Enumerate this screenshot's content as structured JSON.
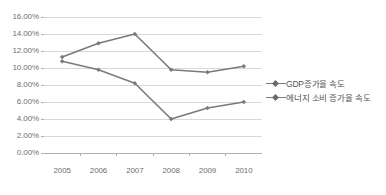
{
  "chart_data": {
    "type": "line",
    "title": "",
    "xlabel": "",
    "ylabel": "",
    "categories": [
      "2005",
      "2006",
      "2007",
      "2008",
      "2009",
      "2010"
    ],
    "ylim": [
      0,
      16
    ],
    "ytick_step": 2,
    "ytick_labels": [
      "16.00%",
      "14.00%",
      "12.00%",
      "10.00%",
      "8.00%",
      "6.00%",
      "4.00%",
      "2.00%",
      "0.00%"
    ],
    "ytick_values": [
      16,
      14,
      12,
      10,
      8,
      6,
      4,
      2,
      0
    ],
    "grid": true,
    "grid_axis": "y",
    "legend_position": "right",
    "series": [
      {
        "name": "GDP증가율 속도",
        "values": [
          11.3,
          12.9,
          14.0,
          9.8,
          9.5,
          10.2
        ],
        "color": "#7a7a7a",
        "marker": "diamond"
      },
      {
        "name": "에너지 소비 증가율 속도",
        "values": [
          10.8,
          9.8,
          8.2,
          4.0,
          5.3,
          6.0
        ],
        "color": "#7a7a7a",
        "marker": "diamond"
      }
    ]
  },
  "legend": {
    "items": [
      {
        "label": "GDP증가율 속도"
      },
      {
        "label": "에너지 소비 증가율 속도"
      }
    ]
  },
  "colors": {
    "axis_text": "#6f6f6f",
    "gridline": "#d9d9d9",
    "axis_line": "#b0b0b0",
    "series_line": "#7a7a7a",
    "background": "#ffffff"
  }
}
